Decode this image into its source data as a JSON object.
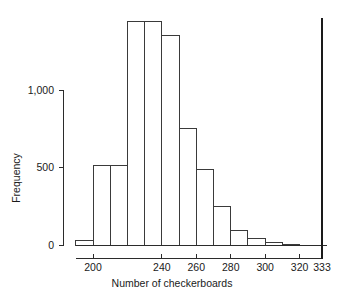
{
  "chart_data": {
    "type": "bar",
    "title": "",
    "subtitle": "",
    "xlabel": "Number of checkerboards",
    "ylabel": "Frequency",
    "categories": [
      "190-200",
      "200-210",
      "210-220",
      "220-230",
      "230-240",
      "240-250",
      "250-260",
      "260-270",
      "270-280",
      "280-290",
      "290-300",
      "300-310",
      "310-320"
    ],
    "bin_edges": [
      190,
      200,
      210,
      220,
      230,
      240,
      250,
      260,
      270,
      280,
      290,
      300,
      310,
      320
    ],
    "values": [
      30,
      30,
      510,
      510,
      1445,
      1350,
      750,
      490,
      250,
      95,
      45,
      15,
      5
    ],
    "bars": [
      {
        "x0": 190,
        "x1": 200,
        "freq": 30
      },
      {
        "x0": 200,
        "x1": 210,
        "freq": 510
      },
      {
        "x0": 210,
        "x1": 220,
        "freq": 510
      },
      {
        "x0": 220,
        "x1": 230,
        "freq": 1445
      },
      {
        "x0": 230,
        "x1": 240,
        "freq": 1445
      },
      {
        "x0": 240,
        "x1": 250,
        "freq": 1350
      },
      {
        "x0": 250,
        "x1": 260,
        "freq": 750
      },
      {
        "x0": 260,
        "x1": 270,
        "freq": 490
      },
      {
        "x0": 270,
        "x1": 280,
        "freq": 250
      },
      {
        "x0": 280,
        "x1": 290,
        "freq": 95
      },
      {
        "x0": 290,
        "x1": 300,
        "freq": 45
      },
      {
        "x0": 300,
        "x1": 310,
        "freq": 15
      },
      {
        "x0": 310,
        "x1": 320,
        "freq": 5
      }
    ],
    "xlim": [
      188,
      336
    ],
    "ylim": [
      0,
      1480
    ],
    "xticks": [
      200,
      240,
      260,
      280,
      300,
      320,
      333
    ],
    "xtick_labels": [
      "200",
      "240",
      "260",
      "280",
      "300",
      "320",
      "333"
    ],
    "yticks": [
      0,
      500,
      1000
    ],
    "ytick_labels": [
      "0",
      "500",
      "1,000"
    ],
    "grid": false,
    "legend": "none",
    "annotations": [
      {
        "name": "observed-value-line",
        "type": "vline",
        "x": 333,
        "label": "333"
      }
    ],
    "colors": {
      "bar_fill": "#ffffff",
      "bar_stroke": "#3a3a3a",
      "axis": "#2b2b2b",
      "reference_line": "#1a1a1a",
      "background": "#ffffff",
      "text": "#1a1a1a"
    }
  },
  "axes": {
    "x_title": "Number of checkerboards",
    "y_title": "Frequency"
  }
}
